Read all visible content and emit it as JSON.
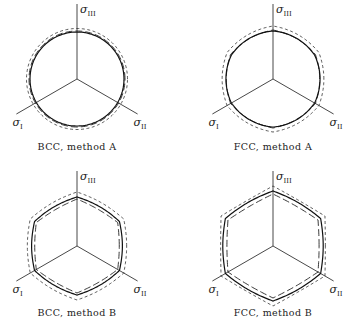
{
  "figure": {
    "axis_labels": {
      "one": {
        "symbol": "σ",
        "subscript": "I"
      },
      "two": {
        "symbol": "σ",
        "subscript": "II"
      },
      "three": {
        "symbol": "σ",
        "subscript": "III"
      }
    },
    "panels": [
      {
        "id": "bcc-a",
        "caption": "BCC, method A",
        "cx": 77,
        "cy": 79,
        "shape": "circle",
        "r_solid": 47,
        "r_long": 48,
        "r_short": 50.5
      },
      {
        "id": "fcc-a",
        "caption": "FCC, method A",
        "cx": 273,
        "cy": 79,
        "shape": "near-circle-hexagonal",
        "r_solid": 48,
        "r_long": 49,
        "r_short": 53
      },
      {
        "id": "bcc-b",
        "caption": "BCC, method B",
        "cx": 77,
        "cy": 246,
        "shape": "rounded-hexagon",
        "r_solid": 49,
        "r_long": 47,
        "r_short": 54
      },
      {
        "id": "fcc-b",
        "caption": "FCC, method B",
        "cx": 273,
        "cy": 246,
        "shape": "rounded-hexagon-large",
        "r_solid": 55,
        "r_long": 52,
        "r_short": 60
      }
    ],
    "legend_styles": [
      "solid",
      "long-dashed",
      "short-dashed"
    ]
  }
}
